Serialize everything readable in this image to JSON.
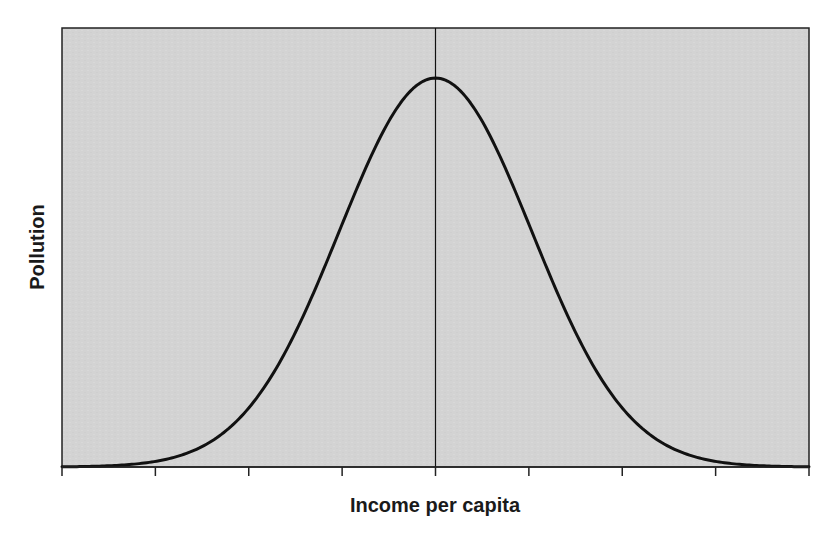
{
  "chart_data": {
    "type": "line",
    "title": "",
    "xlabel": "Income per capita",
    "ylabel": "Pollution",
    "xlim": [
      0,
      8
    ],
    "ylim": [
      0,
      1
    ],
    "x_ticks": [
      0,
      1,
      2,
      3,
      4,
      5,
      6,
      7,
      8
    ],
    "x_tick_labels": [
      "",
      "",
      "",
      "",
      "",
      "",
      "",
      "",
      ""
    ],
    "y_ticks": [],
    "grid": false,
    "legend": null,
    "background_color": "#d3d3d3",
    "line_color": "#111111",
    "annotations": [
      {
        "type": "vline",
        "x": 4,
        "color": "#111111",
        "description": "vertical line at peak (turning point)"
      }
    ],
    "series": [
      {
        "name": "Pollution curve (inverted U / Environmental Kuznets curve)",
        "shape": "gaussian",
        "center": 4,
        "sigma": 1.03,
        "peak": 0.886,
        "x": [
          0,
          0.5,
          1,
          1.5,
          2,
          2.5,
          3,
          3.25,
          3.5,
          3.75,
          4,
          4.25,
          4.5,
          4.75,
          5,
          5.5,
          6,
          6.5,
          7,
          7.5,
          8
        ],
        "values": [
          0.0,
          0.004,
          0.013,
          0.044,
          0.135,
          0.305,
          0.551,
          0.678,
          0.787,
          0.862,
          0.886,
          0.862,
          0.787,
          0.678,
          0.551,
          0.305,
          0.135,
          0.044,
          0.013,
          0.004,
          0.0
        ]
      }
    ]
  },
  "plot": {
    "x_axis_title": "Income per capita",
    "y_axis_title": "Pollution"
  }
}
